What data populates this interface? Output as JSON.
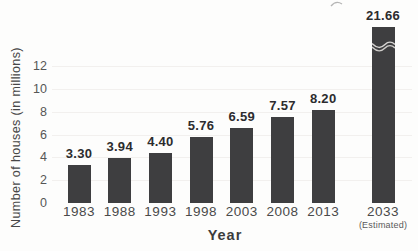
{
  "chart_data": {
    "type": "bar",
    "categories": [
      "1983",
      "1988",
      "1993",
      "1998",
      "2003",
      "2008",
      "2013",
      "2033"
    ],
    "category_sublabels": [
      "",
      "",
      "",
      "",
      "",
      "",
      "",
      "(Estimated)"
    ],
    "values": [
      3.3,
      3.94,
      4.4,
      5.76,
      6.59,
      7.57,
      8.2,
      21.66
    ],
    "value_labels": [
      "3.30",
      "3.94",
      "4.40",
      "5.76",
      "6.59",
      "7.57",
      "8.20",
      "21.66"
    ],
    "xlabel": "Year",
    "ylabel": "Number of houses (in millions)",
    "yticks": [
      0,
      2,
      4,
      6,
      8,
      10,
      12
    ],
    "ylim": [
      0,
      13
    ],
    "grid": "faint-horizontal",
    "legend": "none",
    "bar_color": "#3e3e40",
    "axis_break_bar": "2033",
    "axis_break_note": "bar exceeds axis range; shown with wavy break symbol"
  }
}
